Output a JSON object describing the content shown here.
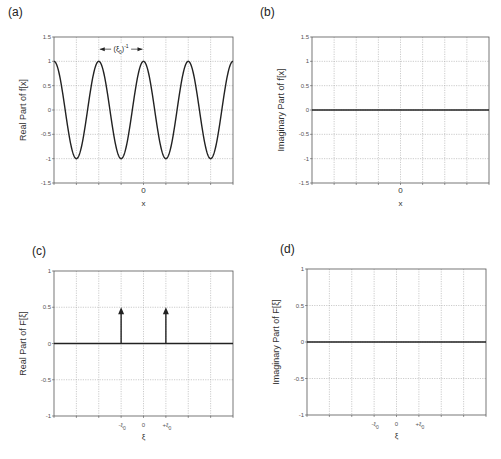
{
  "figure": {
    "panels": [
      {
        "id": "a",
        "label": "(a)",
        "ylabel": "Real Part of f[x]",
        "xlabel": "x",
        "yticks": [
          "1.5",
          "1",
          "0.5",
          "0",
          "-0.5",
          "-1",
          "-1.5"
        ],
        "xtick_center": "0",
        "annotation": "(ξ0)-1"
      },
      {
        "id": "b",
        "label": "(b)",
        "ylabel": "Imaginary Part of f[x]",
        "xlabel": "x",
        "yticks": [
          "1.5",
          "1",
          "0.5",
          "0",
          "-0.5",
          "-1",
          "-1.5"
        ],
        "xtick_center": "0"
      },
      {
        "id": "c",
        "label": "(c)",
        "ylabel": "Real Part of F[ξ]",
        "xlabel": "ξ",
        "yticks": [
          "1",
          "0.5",
          "0",
          "-0.5",
          "-1"
        ],
        "xticks": [
          "-ξ0",
          "0",
          "+ξ0"
        ]
      },
      {
        "id": "d",
        "label": "(d)",
        "ylabel": "Imaginary Part of F[ξ]",
        "xlabel": "ξ",
        "yticks": [
          "1",
          "0.5",
          "0",
          "-0.5",
          "-1"
        ],
        "xticks": [
          "-ξ0",
          "0",
          "+ξ0"
        ]
      }
    ]
  },
  "chart_data": [
    {
      "type": "line",
      "title": "(a)",
      "xlabel": "x",
      "ylabel": "Real Part of f[x]",
      "ylim": [
        -1.5,
        1.5
      ],
      "grid": true,
      "function": "cos(2*pi*xi0*x)",
      "period_grid_units": 2,
      "x": [
        -4,
        -3,
        -2,
        -1,
        0,
        1,
        2,
        3,
        4
      ],
      "values": [
        1,
        -1,
        1,
        -1,
        1,
        -1,
        1,
        -1,
        1
      ],
      "annotation": "(ξ0)^-1 period marker between peaks at x=-2 and x=0"
    },
    {
      "type": "line",
      "title": "(b)",
      "xlabel": "x",
      "ylabel": "Imaginary Part of f[x]",
      "ylim": [
        -1.5,
        1.5
      ],
      "grid": true,
      "x": [
        -4,
        4
      ],
      "values": [
        0,
        0
      ]
    },
    {
      "type": "line",
      "title": "(c)",
      "xlabel": "ξ",
      "ylabel": "Real Part of F[ξ]",
      "ylim": [
        -1,
        1
      ],
      "grid": true,
      "baseline": 0,
      "impulses": [
        {
          "x": "-ξ0",
          "value": 0.5
        },
        {
          "x": "+ξ0",
          "value": 0.5
        }
      ]
    },
    {
      "type": "line",
      "title": "(d)",
      "xlabel": "ξ",
      "ylabel": "Imaginary Part of F[ξ]",
      "ylim": [
        -1,
        1
      ],
      "grid": true,
      "x": [
        -4,
        4
      ],
      "values": [
        0,
        0
      ]
    }
  ]
}
